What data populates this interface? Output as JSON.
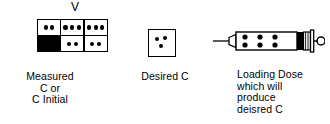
{
  "diagram": {
    "title_marker": "V",
    "volume_grid": {
      "columns": 3,
      "rows": 2,
      "cells": [
        {
          "filled": false,
          "dot_count": 2
        },
        {
          "filled": false,
          "dot_count": 3
        },
        {
          "filled": false,
          "dot_count": 3
        },
        {
          "filled": true,
          "dot_count": 0
        },
        {
          "filled": false,
          "dot_count": 2
        },
        {
          "filled": false,
          "dot_count": 2
        }
      ],
      "caption": "Measured\nC or\nC Initial"
    },
    "desired_box": {
      "dot_count": 3,
      "caption": "Desired C"
    },
    "syringe": {
      "dot_rows": 2,
      "dot_columns": 3,
      "dot_count": 6,
      "caption": "Loading Dose\nwhich will\nproduce\ndeisred C"
    },
    "colors": {
      "ink": "#000000",
      "background": "#ffffff"
    }
  }
}
